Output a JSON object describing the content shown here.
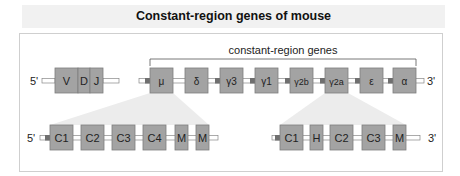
{
  "title": "Constant-region genes of mouse",
  "bracket_label": "constant-region genes",
  "colors": {
    "box_fill": "#a3a3a3",
    "box_stroke": "#7d7d7d",
    "fan_fill": "#ececec",
    "title_band": "#f1f1f1",
    "switch_region": "#6f6f6f"
  },
  "top_row": {
    "five_prime": "5'",
    "three_prime": "3'",
    "vdj": [
      "V",
      "D",
      "J"
    ],
    "constant_genes": [
      "μ",
      "δ",
      "γ3",
      "γ1",
      "γ2b",
      "γ2a",
      "ε",
      "α"
    ]
  },
  "bottom_left": {
    "five_prime": "5'",
    "exons": [
      "C1",
      "C2",
      "C3",
      "C4",
      "M",
      "M"
    ]
  },
  "bottom_right": {
    "three_prime": "3'",
    "exons": [
      "C1",
      "H",
      "C2",
      "C3",
      "M"
    ]
  }
}
